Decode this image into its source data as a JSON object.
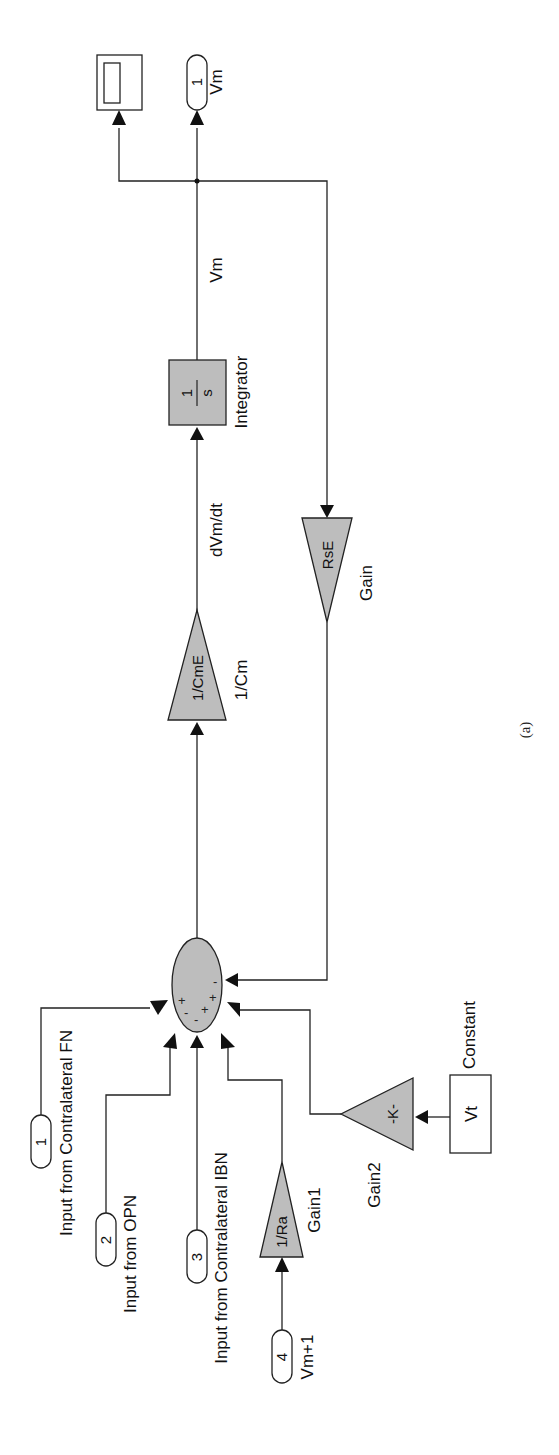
{
  "figure": {
    "caption": "(a)",
    "orientation": "rotated-90-ccw"
  },
  "blocks": {
    "inport1": {
      "number": "1",
      "label": "Input from Contralateral FN"
    },
    "inport2": {
      "number": "2",
      "label": "Input from OPN"
    },
    "inport3": {
      "number": "3",
      "label": "Input from Contralateral IBN"
    },
    "inport4": {
      "number": "4",
      "label": "Vm+1"
    },
    "gain1": {
      "value": "1/Ra",
      "label": "Gain1"
    },
    "gain2": {
      "value": "-K-",
      "label": "Gain2"
    },
    "constant": {
      "value": "Vt",
      "label": "Constant"
    },
    "sum": {
      "signs": [
        "+",
        "-",
        "-",
        "+",
        "+",
        "-"
      ]
    },
    "gain_cm": {
      "value": "1/CmE",
      "label": "1/Cm"
    },
    "integrator": {
      "numerator": "1",
      "denominator": "s",
      "label": "Integrator"
    },
    "gain_rs": {
      "value": "RsE",
      "label": "Gain"
    },
    "outport1": {
      "number": "1",
      "label": "Vm"
    },
    "scope": {
      "label": ""
    }
  },
  "signals": {
    "derivative": "dVm/dt",
    "output": "Vm"
  },
  "colors": {
    "block_fill": "#bdbdbd",
    "line": "#222222",
    "background": "#ffffff"
  }
}
